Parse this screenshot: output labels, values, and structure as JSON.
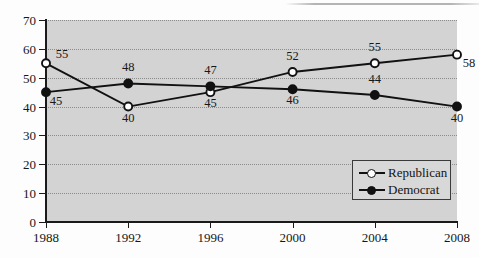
{
  "chart_data": {
    "type": "line",
    "title": "",
    "subtitle": "",
    "xlabel": "",
    "ylabel": "",
    "categories": [
      "1988",
      "1992",
      "1996",
      "2000",
      "2004",
      "2008"
    ],
    "x": [
      1988,
      1992,
      1996,
      2000,
      2004,
      2008
    ],
    "xlim": [
      1988,
      2008
    ],
    "ylim": [
      0,
      70
    ],
    "y_ticks": [
      0,
      10,
      20,
      30,
      40,
      50,
      60,
      70
    ],
    "x_ticks": [
      "1988",
      "1992",
      "1996",
      "2000",
      "2004",
      "2008"
    ],
    "grid": true,
    "grid_style": "dotted horizontal",
    "legend_position": "inside lower right",
    "plot_background": "#d3d3d3",
    "series": [
      {
        "name": "Republican",
        "marker": "open-circle",
        "color": "#111111",
        "values": [
          55,
          40,
          45,
          52,
          55,
          58
        ],
        "data_labels": [
          "55",
          "40",
          "45",
          "52",
          "55",
          "58"
        ]
      },
      {
        "name": "Democrat",
        "marker": "filled-circle",
        "color": "#111111",
        "values": [
          45,
          48,
          47,
          46,
          44,
          40
        ],
        "data_labels": [
          "45",
          "48",
          "47",
          "46",
          "44",
          "40"
        ]
      }
    ]
  },
  "legend": {
    "items": [
      {
        "label": "Republican",
        "marker": "open-circle"
      },
      {
        "label": "Democrat",
        "marker": "filled-circle"
      }
    ]
  }
}
